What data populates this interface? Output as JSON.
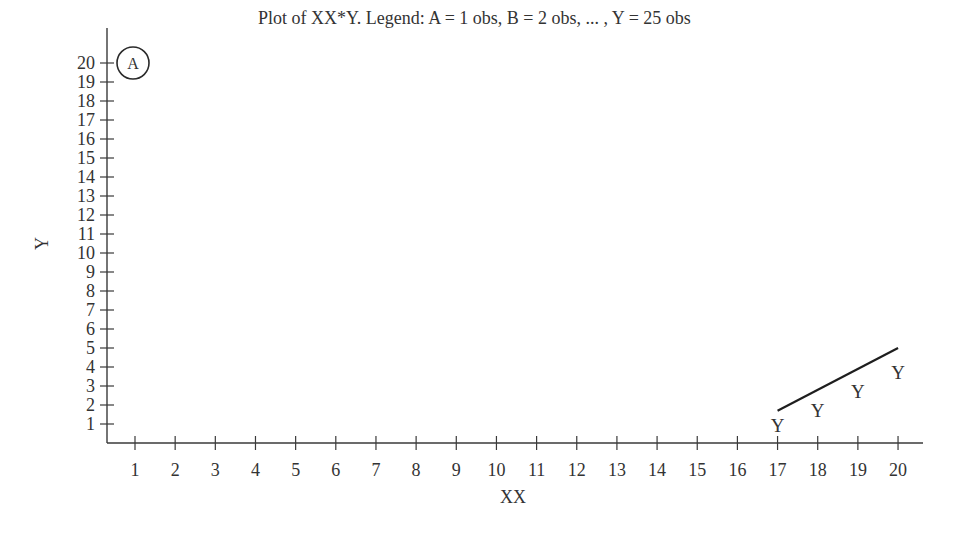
{
  "chart_data": {
    "type": "scatter",
    "title": "Plot of XX*Y. Legend: A = 1 obs, B = 2 obs, ... , Y = 25 obs",
    "xlabel": "XX",
    "ylabel": "Y",
    "xlim": [
      1,
      20
    ],
    "ylim": [
      1,
      20
    ],
    "x_ticks": [
      1,
      2,
      3,
      4,
      5,
      6,
      7,
      8,
      9,
      10,
      11,
      12,
      13,
      14,
      15,
      16,
      17,
      18,
      19,
      20
    ],
    "y_ticks": [
      1,
      2,
      3,
      4,
      5,
      6,
      7,
      8,
      9,
      10,
      11,
      12,
      13,
      14,
      15,
      16,
      17,
      18,
      19,
      20
    ],
    "grid": false,
    "legend": "A = 1 obs, B = 2 obs, ... , Y = 25 obs",
    "series": [
      {
        "name": "Y",
        "marker": "Y",
        "obs": 25,
        "points": [
          {
            "x": 17,
            "y": 1.0
          },
          {
            "x": 18,
            "y": 1.8
          },
          {
            "x": 19,
            "y": 2.8
          },
          {
            "x": 20,
            "y": 3.8
          }
        ]
      },
      {
        "name": "A",
        "marker": "A",
        "obs": 1,
        "circled": true,
        "points": [
          {
            "x": 1,
            "y": 20
          }
        ]
      }
    ],
    "annotations": [
      {
        "type": "line",
        "from": {
          "x": 17,
          "y": 1.7
        },
        "to": {
          "x": 20,
          "y": 5.0
        }
      },
      {
        "type": "circle",
        "label": "A",
        "at": {
          "x": 1,
          "y": 20
        }
      }
    ]
  }
}
